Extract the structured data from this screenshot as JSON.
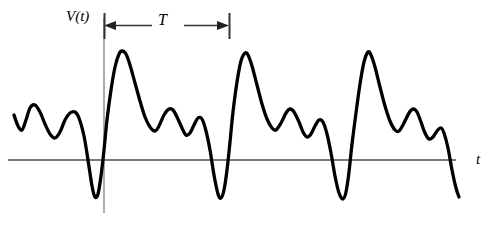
{
  "figure": {
    "title": "",
    "background_color": "#ffffff",
    "width": 502,
    "height": 234
  },
  "labels": {
    "vertical_axis": "V(t)",
    "horizontal_axis": "t",
    "period": "T"
  },
  "colors": {
    "waveform": "#000000",
    "axis": "#4d4d4d",
    "dimension_line": "#333333",
    "text": "#000000"
  },
  "chart_data": {
    "type": "line",
    "title": "",
    "subtitle": "",
    "xlabel": "t",
    "ylabel": "V(t)",
    "grid": false,
    "legend": null,
    "annotations": [
      {
        "name": "period-marker",
        "label": "T",
        "description": "Double-headed arrow spanning one period of the waveform",
        "x_start": 104,
        "x_end": 228,
        "value": 124
      },
      {
        "name": "vertical-axis-line",
        "label": "V(t)",
        "description": "Vertical reference axis at the start of one period",
        "x": 104
      },
      {
        "name": "horizontal-axis-line",
        "label": "t",
        "description": "Zero-level time axis",
        "y": 160
      }
    ],
    "axis_ranges": {
      "x": [
        0,
        502
      ],
      "y": [
        0,
        234
      ],
      "zero_level_y": 160
    },
    "period_px": 123,
    "series": [
      {
        "name": "V(t)",
        "description": "Quasi-periodic pulse waveform: a tall sharp positive peak followed by decaying secondary oscillations and a deep negative trough, repeating three times.",
        "color": "#000000",
        "points": [
          [
            14,
            115
          ],
          [
            18,
            126
          ],
          [
            22,
            130
          ],
          [
            26,
            120
          ],
          [
            30,
            108
          ],
          [
            35,
            105
          ],
          [
            40,
            112
          ],
          [
            45,
            124
          ],
          [
            50,
            134
          ],
          [
            55,
            138
          ],
          [
            60,
            132
          ],
          [
            65,
            120
          ],
          [
            70,
            113
          ],
          [
            75,
            112
          ],
          [
            79,
            118
          ],
          [
            84,
            136
          ],
          [
            88,
            160
          ],
          [
            92,
            186
          ],
          [
            95,
            197
          ],
          [
            98,
            194
          ],
          [
            101,
            176
          ],
          [
            104,
            150
          ],
          [
            107,
            120
          ],
          [
            111,
            90
          ],
          [
            115,
            67
          ],
          [
            119,
            54
          ],
          [
            122,
            51
          ],
          [
            126,
            54
          ],
          [
            130,
            65
          ],
          [
            135,
            83
          ],
          [
            140,
            101
          ],
          [
            145,
            117
          ],
          [
            150,
            127
          ],
          [
            155,
            131
          ],
          [
            159,
            126
          ],
          [
            164,
            115
          ],
          [
            169,
            109
          ],
          [
            173,
            110
          ],
          [
            177,
            117
          ],
          [
            182,
            128
          ],
          [
            186,
            135
          ],
          [
            190,
            133
          ],
          [
            194,
            125
          ],
          [
            198,
            118
          ],
          [
            202,
            119
          ],
          [
            206,
            131
          ],
          [
            210,
            150
          ],
          [
            214,
            175
          ],
          [
            218,
            194
          ],
          [
            221,
            198
          ],
          [
            224,
            190
          ],
          [
            227,
            170
          ],
          [
            230,
            142
          ],
          [
            233,
            112
          ],
          [
            237,
            82
          ],
          [
            241,
            61
          ],
          [
            245,
            53
          ],
          [
            248,
            55
          ],
          [
            252,
            66
          ],
          [
            257,
            85
          ],
          [
            262,
            104
          ],
          [
            267,
            119
          ],
          [
            272,
            128
          ],
          [
            276,
            130
          ],
          [
            281,
            123
          ],
          [
            286,
            113
          ],
          [
            290,
            109
          ],
          [
            294,
            112
          ],
          [
            299,
            122
          ],
          [
            303,
            132
          ],
          [
            307,
            137
          ],
          [
            311,
            134
          ],
          [
            315,
            126
          ],
          [
            319,
            120
          ],
          [
            323,
            122
          ],
          [
            327,
            134
          ],
          [
            331,
            153
          ],
          [
            335,
            176
          ],
          [
            339,
            193
          ],
          [
            343,
            199
          ],
          [
            346,
            192
          ],
          [
            349,
            172
          ],
          [
            352,
            144
          ],
          [
            356,
            113
          ],
          [
            360,
            84
          ],
          [
            364,
            62
          ],
          [
            368,
            52
          ],
          [
            371,
            55
          ],
          [
            375,
            67
          ],
          [
            380,
            87
          ],
          [
            385,
            106
          ],
          [
            390,
            121
          ],
          [
            395,
            130
          ],
          [
            399,
            131
          ],
          [
            404,
            123
          ],
          [
            409,
            113
          ],
          [
            413,
            109
          ],
          [
            417,
            112
          ],
          [
            421,
            122
          ],
          [
            425,
            133
          ],
          [
            429,
            139
          ],
          [
            433,
            137
          ],
          [
            437,
            131
          ],
          [
            441,
            128
          ],
          [
            444,
            133
          ],
          [
            448,
            148
          ],
          [
            452,
            170
          ],
          [
            456,
            188
          ],
          [
            459,
            197
          ]
        ]
      }
    ]
  }
}
